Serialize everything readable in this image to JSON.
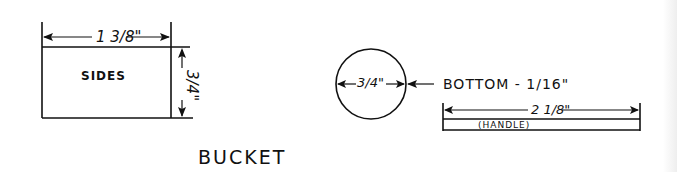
{
  "drawing": {
    "title": "BUCKET",
    "sides": {
      "label": "SIDES",
      "width_dimension": "1 3/8\"",
      "height_dimension": "3/4\""
    },
    "bottom": {
      "diameter_dimension": "3/4\"",
      "label": "BOTTOM - 1/16\""
    },
    "handle": {
      "label": "(HANDLE)",
      "length_dimension": "2 1/8\""
    }
  },
  "colors": {
    "ink": "#111111",
    "paper": "#ffffff"
  }
}
